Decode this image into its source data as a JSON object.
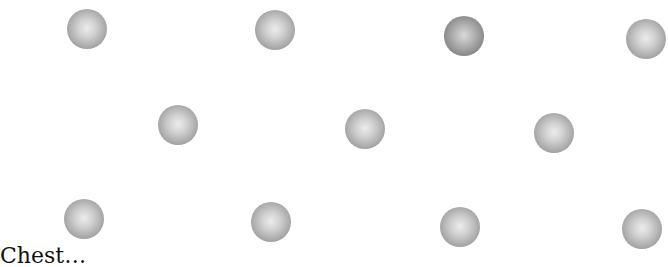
{
  "diagram": {
    "rows": [
      {
        "name": "top",
        "spheres": [
          {
            "x": 87,
            "y": 29
          },
          {
            "x": 275,
            "y": 30
          },
          {
            "x": 464,
            "y": 36
          },
          {
            "x": 646,
            "y": 39
          }
        ]
      },
      {
        "name": "middle",
        "spheres": [
          {
            "x": 178,
            "y": 125
          },
          {
            "x": 365,
            "y": 129
          },
          {
            "x": 554,
            "y": 133
          }
        ]
      },
      {
        "name": "bottom",
        "spheres": [
          {
            "x": 84,
            "y": 219
          },
          {
            "x": 271,
            "y": 222
          },
          {
            "x": 460,
            "y": 227
          },
          {
            "x": 642,
            "y": 229
          }
        ]
      }
    ],
    "caption": "Chest…"
  }
}
